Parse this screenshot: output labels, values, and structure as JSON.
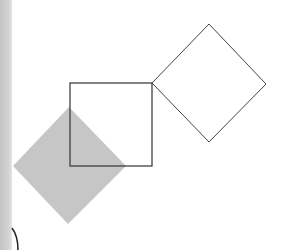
{
  "figure": {
    "type": "geometric-construction",
    "background": "#ffffff",
    "page_edge_color": "#c8c8c8",
    "square": {
      "x": 70,
      "y": 83,
      "width": 82,
      "height": 83,
      "stroke": "#333333",
      "fill": "none"
    },
    "outlined_diamond": {
      "points": [
        [
          209,
          24
        ],
        [
          266,
          84
        ],
        [
          209,
          142
        ],
        [
          152,
          83
        ]
      ],
      "stroke": "#444444",
      "fill": "none"
    },
    "shaded_diamond": {
      "points": [
        [
          69,
          107
        ],
        [
          126,
          166
        ],
        [
          68,
          224
        ],
        [
          13,
          166
        ]
      ],
      "fill": "#c6c6c6",
      "stroke": "none"
    },
    "edge_curve": {
      "path": "M 12 228 Q 18 236 18 250",
      "stroke": "#222222"
    }
  }
}
